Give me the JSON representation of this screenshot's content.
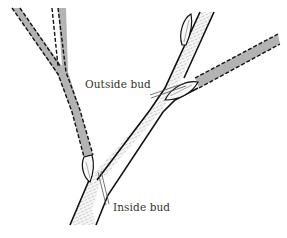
{
  "figure": {
    "labels": {
      "outside_bud": "Outside bud",
      "inside_bud": "Inside bud"
    },
    "colors": {
      "stem_outline": "#111111",
      "pruned_branch_fill": "#b3b3b3",
      "stem_fill": "#f4f4f4",
      "text": "#333333"
    }
  }
}
